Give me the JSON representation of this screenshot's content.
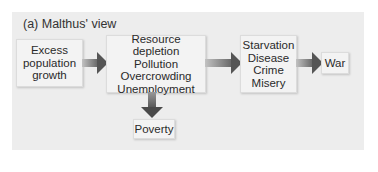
{
  "title": "(a)  Malthus' view",
  "nodes": {
    "excess_growth": [
      "Excess",
      "population",
      "growth"
    ],
    "resource": [
      "Resource depletion",
      "Pollution",
      "Overcrowding",
      "Unemployment"
    ],
    "starvation": [
      "Starvation",
      "Disease",
      "Crime",
      "Misery"
    ],
    "war": [
      "War"
    ],
    "poverty": [
      "Poverty"
    ]
  },
  "edges": [
    {
      "from": "excess_growth",
      "to": "resource"
    },
    {
      "from": "resource",
      "to": "starvation"
    },
    {
      "from": "starvation",
      "to": "war"
    },
    {
      "from": "resource",
      "to": "poverty"
    }
  ],
  "colors": {
    "panel": "#ededed",
    "box": "#f3f3f3",
    "arrow": "#555555"
  }
}
